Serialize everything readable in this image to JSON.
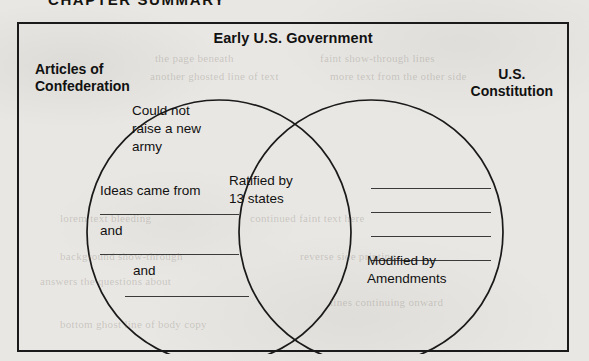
{
  "page": {
    "chapter_heading": "CHAPTER SUMMARY",
    "background_color": "#e9e7e3",
    "ink_color": "#111111"
  },
  "diagram": {
    "type": "venn",
    "title": "Early U.S. Government",
    "left_label": "Articles of\nConfederation",
    "right_label": "U.S.\nConstitution",
    "left_only": [
      {
        "text": "Could not\nraise a new\narmy"
      },
      {
        "text": "Ideas came from"
      },
      {
        "text": "and"
      },
      {
        "text": "and"
      }
    ],
    "overlap": [
      {
        "text": "Ratified by\n13 states"
      }
    ],
    "right_only": [
      {
        "text": "Modified by\nAmendments"
      }
    ],
    "blanks": {
      "left_count": 3,
      "right_count": 4,
      "value": ""
    }
  },
  "bleed_through": [
    {
      "text": "the page beneath",
      "left": 155,
      "top": 52
    },
    {
      "text": "faint show-through lines",
      "left": 320,
      "top": 52
    },
    {
      "text": "another ghosted line of text",
      "left": 150,
      "top": 70
    },
    {
      "text": "more text from the other side",
      "left": 330,
      "top": 70
    },
    {
      "text": "lorem text bleeding",
      "left": 60,
      "top": 212
    },
    {
      "text": "continued faint text here",
      "left": 250,
      "top": 212
    },
    {
      "text": "background show-through",
      "left": 60,
      "top": 250
    },
    {
      "text": "reverse side printing",
      "left": 300,
      "top": 250
    },
    {
      "text": "answers the questions about",
      "left": 40,
      "top": 275
    },
    {
      "text": "lines continuing onward",
      "left": 330,
      "top": 296
    },
    {
      "text": "bottom ghost line of body copy",
      "left": 60,
      "top": 318
    }
  ]
}
